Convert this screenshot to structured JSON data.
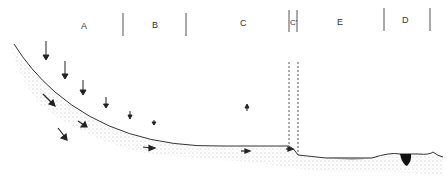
{
  "diagram": {
    "zones": [
      {
        "label": "A",
        "x": 84
      },
      {
        "label": "B",
        "x": 155
      },
      {
        "label": "C",
        "x": 244
      },
      {
        "label": "C'",
        "x": 292
      },
      {
        "label": "E",
        "x": 340
      },
      {
        "label": "D",
        "x": 405
      }
    ],
    "dividers_x": [
      123,
      186,
      289,
      298,
      384,
      430
    ],
    "colors": {
      "line": "#333333",
      "stipple": "#888888",
      "water": "#555555",
      "pit": "#111111"
    }
  }
}
